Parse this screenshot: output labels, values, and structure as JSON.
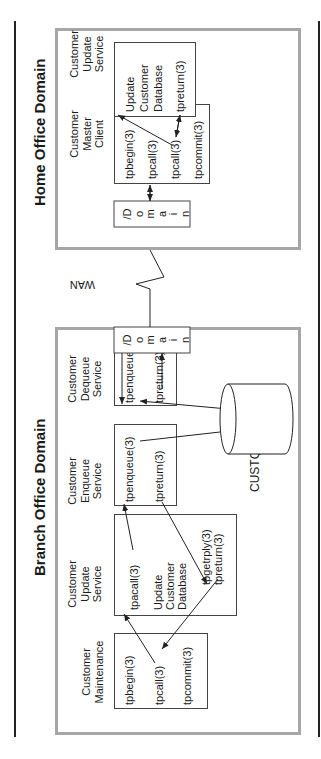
{
  "branch_office": {
    "title": "Branch Office Domain",
    "maintenance": {
      "label_line1": "Customer",
      "label_line2": "Maintenance",
      "fn1": "tpbegin(3)",
      "fn2": "tpcall(3)",
      "fn3": "tpcommit(3)"
    },
    "update_service": {
      "label_line1": "Customer",
      "label_line2": "Update",
      "label_line3": "Service",
      "fn1": "tpacall(3)",
      "body1": "Update",
      "body2": "Customer",
      "body3": "Database",
      "fn2": "tpgetrply(3)",
      "fn3": "tpreturn(3)"
    },
    "enqueue_service": {
      "label_line1": "Customer",
      "label_line2": "Enqueue",
      "label_line3": "Service",
      "fn1": "tpenqueue(3)",
      "fn2": "tpreturn(3)"
    },
    "dequeue_service": {
      "label_line1": "Customer",
      "label_line2": "Dequeue",
      "label_line3": "Service",
      "fn1": "tpenqueue(3)",
      "fn2": "tpreturn(3)"
    },
    "domain_gateway": {
      "letters": [
        "/D",
        "o",
        "m",
        "a",
        "i",
        "n"
      ]
    },
    "queue": {
      "label": "CUSTQ"
    }
  },
  "wan": {
    "label": "WAN"
  },
  "home_office": {
    "title": "Home Office Domain",
    "domain_gateway": {
      "letters": [
        "/D",
        "o",
        "m",
        "a",
        "i",
        "n"
      ]
    },
    "master_client": {
      "label_line1": "Customer",
      "label_line2": "Master",
      "label_line3": "Client",
      "fn1": "tpbegin(3)",
      "fn2": "tpcall(3)",
      "fn3": "tpcall(3)",
      "fn4": "tpcommit(3)"
    },
    "update_service": {
      "label_line1": "Customer",
      "label_line2": "Update",
      "label_line3": "Service",
      "body1": "Update",
      "body2": "Customer",
      "body3": "Database",
      "fn1": "tpreturn(3)"
    }
  },
  "colors": {
    "domain_border": "#a6a6a6",
    "box_border": "#444444",
    "text": "#1a1a1a"
  }
}
